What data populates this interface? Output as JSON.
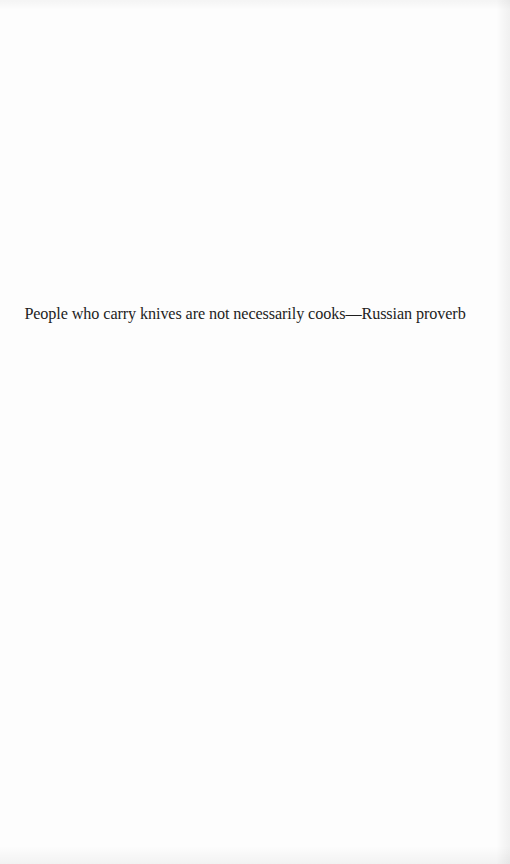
{
  "page": {
    "epigraph": {
      "quote": "People who carry knives are not necessarily cooks",
      "separator": "—",
      "attribution": "Russian proverb"
    }
  }
}
